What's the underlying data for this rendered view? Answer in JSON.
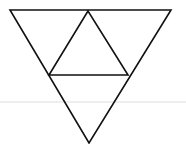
{
  "diagram": {
    "title": "",
    "stroke_color": "#111111",
    "background": "#ffffff",
    "guide_line_color": "#e6e6e6",
    "shapes": [
      {
        "name": "outer-triangle",
        "type": "triangle",
        "points": [
          [
            10,
            10
          ],
          [
            171,
            10
          ],
          [
            89,
            143
          ]
        ]
      },
      {
        "name": "inner-triangle",
        "type": "triangle",
        "points": [
          [
            88,
            11
          ],
          [
            49,
            75
          ],
          [
            128,
            75
          ]
        ]
      }
    ]
  }
}
